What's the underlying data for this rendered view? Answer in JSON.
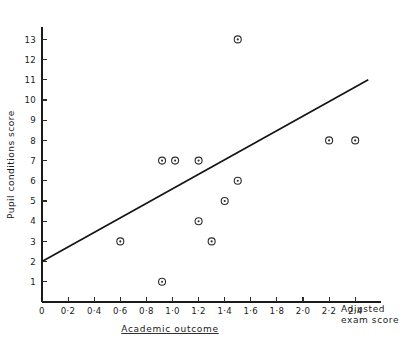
{
  "chart_data": {
    "type": "scatter",
    "title": "",
    "subtitle": "",
    "xlabel": "Academic outcome",
    "xlabel_secondary_line1": "Adjusted",
    "xlabel_secondary_line2": "exam score",
    "ylabel": "Pupil conditions score",
    "xlim": [
      0,
      2.6
    ],
    "ylim": [
      0,
      13.6
    ],
    "grid": false,
    "legend": "none",
    "x_ticks": [
      0,
      0.2,
      0.4,
      0.6,
      0.8,
      1.0,
      1.2,
      1.4,
      1.6,
      1.8,
      2.0,
      2.2,
      2.4
    ],
    "x_tick_labels": [
      "0",
      "0·2",
      "0·4",
      "0·6",
      "0·8",
      "1·0",
      "1·2",
      "1·4",
      "1·6",
      "1·8",
      "2·0",
      "2·2",
      "2·4"
    ],
    "y_ticks": [
      1,
      2,
      3,
      4,
      5,
      6,
      7,
      8,
      9,
      10,
      11,
      12,
      13
    ],
    "y_tick_labels": [
      "1",
      "2",
      "3",
      "4",
      "5",
      "6",
      "7",
      "8",
      "9",
      "10",
      "11",
      "12",
      "13"
    ],
    "marker_style": "open-circle-with-center-dot",
    "points": [
      {
        "x": 0.6,
        "y": 3
      },
      {
        "x": 0.92,
        "y": 1
      },
      {
        "x": 0.92,
        "y": 7
      },
      {
        "x": 1.02,
        "y": 7
      },
      {
        "x": 1.2,
        "y": 7
      },
      {
        "x": 1.2,
        "y": 4
      },
      {
        "x": 1.3,
        "y": 3
      },
      {
        "x": 1.4,
        "y": 5
      },
      {
        "x": 1.5,
        "y": 6
      },
      {
        "x": 1.5,
        "y": 13
      },
      {
        "x": 2.2,
        "y": 8
      },
      {
        "x": 2.4,
        "y": 8
      }
    ],
    "trend_line": {
      "x_start": 0.0,
      "y_start": 2.0,
      "x_end": 2.5,
      "y_end": 11.0
    },
    "colors": {
      "axis": "#1a1a1a",
      "marker": "#2d2d2d",
      "trend": "#141414",
      "background": "#ffffff"
    }
  }
}
